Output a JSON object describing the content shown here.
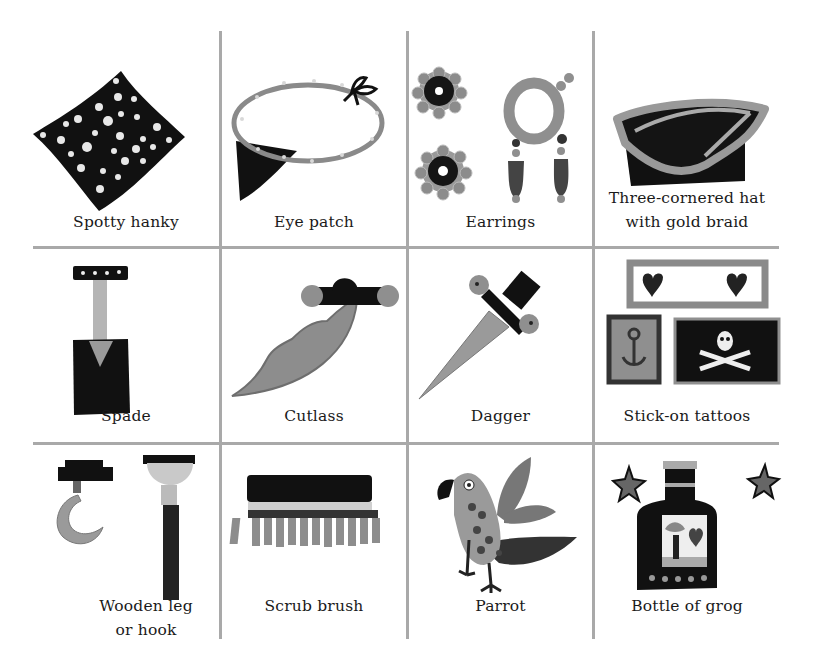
{
  "page": {
    "background": "#ffffff",
    "grid_line_color": "#a9a9a9",
    "rows": [
      {
        "items": [
          {
            "label": "Spotty hanky",
            "icon": "spotty-hanky-icon"
          },
          {
            "label": "Eye patch",
            "icon": "eye-patch-icon"
          },
          {
            "label": "Earrings",
            "icon": "earrings-icon"
          },
          {
            "label_line1": "Three-cornered hat",
            "label_line2": "with gold braid",
            "icon": "three-cornered-hat-icon"
          }
        ]
      },
      {
        "items": [
          {
            "label": "Spade",
            "icon": "spade-icon"
          },
          {
            "label": "Cutlass",
            "icon": "cutlass-icon"
          },
          {
            "label": "Dagger",
            "icon": "dagger-icon"
          },
          {
            "label": "Stick-on tattoos",
            "icon": "tattoos-icon"
          }
        ]
      },
      {
        "items": [
          {
            "label_line1": "Wooden leg",
            "label_line2": "or hook",
            "icon": "wooden-leg-hook-icon"
          },
          {
            "label": "Scrub brush",
            "icon": "scrub-brush-icon"
          },
          {
            "label": "Parrot",
            "icon": "parrot-icon"
          },
          {
            "label": "Bottle of grog",
            "icon": "bottle-of-grog-icon"
          }
        ]
      }
    ]
  }
}
